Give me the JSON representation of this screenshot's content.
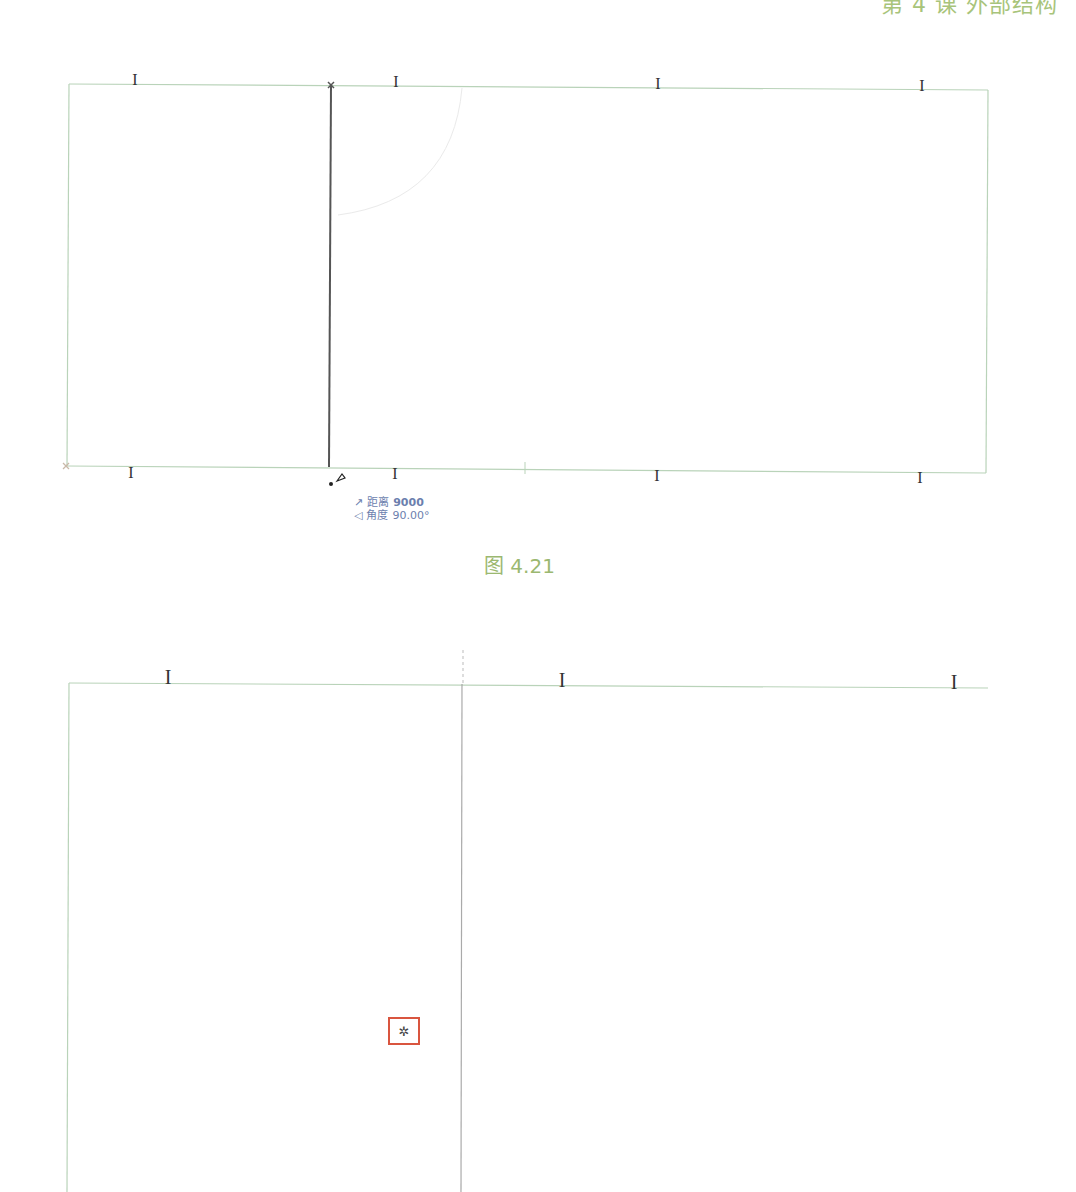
{
  "page_header": {
    "text": "第 4 课   外部结构",
    "color": "#a8c47a"
  },
  "figure_top": {
    "caption": "图 4.21",
    "tooltip": {
      "distance_icon": "↗",
      "distance_label": "距离",
      "distance_value": "9000",
      "angle_icon": "◁",
      "angle_label": "角度",
      "angle_value": "90.00°"
    },
    "beam_symbol": "I",
    "wall_color": "#b9d3b9",
    "drawn_line_color": "#444444"
  },
  "figure_bottom": {
    "beam_symbol": "I",
    "snap_marker_symbol": "✲",
    "snap_marker_color": "#d9553f"
  }
}
